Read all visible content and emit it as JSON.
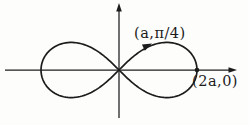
{
  "figure": {
    "curve": {
      "type": "lemniscate",
      "center_x": 119,
      "center_y": 70,
      "half_width": 78
    },
    "labels": {
      "upper_point": "(a,π/4)",
      "right_point": "(2a,0)"
    },
    "colors": {
      "stroke": "#1c1c1c",
      "background": "#fdfdfc"
    }
  }
}
